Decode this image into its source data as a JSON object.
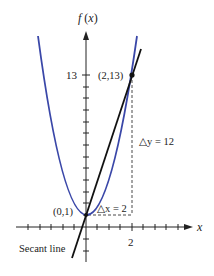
{
  "diagram": {
    "y_axis_label": "f (x)",
    "x_axis_label": "x",
    "y_tick_label": "13",
    "x_tick_label": "2",
    "point_top_label": "(2,13)",
    "point_vertex_label": "(0,1)",
    "delta_x_label": "△x = 2",
    "delta_y_label": "△y  =  12",
    "secant_label": "Secant line",
    "colors": {
      "parabola": "#3a47a8",
      "secant": "#111111",
      "axes": "#222222"
    }
  }
}
